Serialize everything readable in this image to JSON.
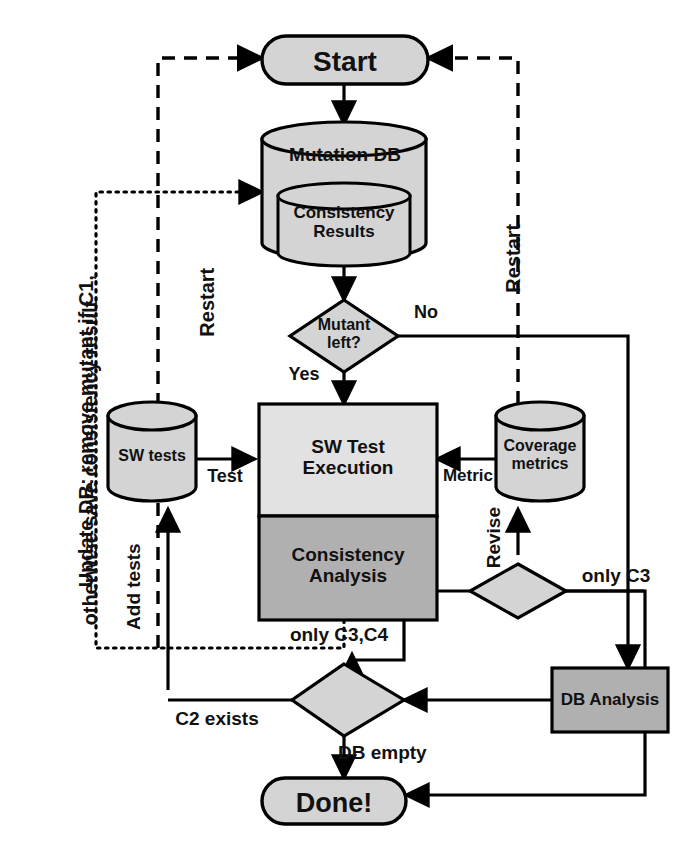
{
  "diagram": {
    "colors": {
      "light_fill": "#d4d4d4",
      "dark_fill": "#b0b0b0",
      "stroke": "#000000",
      "background": "#ffffff"
    },
    "nodes": [
      {
        "id": "start",
        "shape": "rounded-rect",
        "label": "Start",
        "fill": "light"
      },
      {
        "id": "mutation-db",
        "shape": "cylinder",
        "label": "Mutation DB",
        "fill": "light"
      },
      {
        "id": "consistency-results",
        "shape": "cylinder",
        "label": "Consistency\nResults",
        "fill": "light"
      },
      {
        "id": "mutant-left",
        "shape": "diamond",
        "label": "Mutant\nleft?",
        "fill": "light"
      },
      {
        "id": "sw-tests",
        "shape": "cylinder",
        "label": "SW tests",
        "fill": "light"
      },
      {
        "id": "sw-test-execution",
        "shape": "rect",
        "label": "SW Test\nExecution",
        "fill": "light"
      },
      {
        "id": "consistency-analysis",
        "shape": "rect",
        "label": "Consistency\nAnalysis",
        "fill": "dark"
      },
      {
        "id": "coverage-metrics",
        "shape": "cylinder",
        "label": "Coverage\nmetrics",
        "fill": "light"
      },
      {
        "id": "revise-decision",
        "shape": "diamond",
        "label": "",
        "fill": "light"
      },
      {
        "id": "db-decision",
        "shape": "diamond",
        "label": "",
        "fill": "light"
      },
      {
        "id": "db-analysis",
        "shape": "rect",
        "label": "DB Analysis",
        "fill": "dark"
      },
      {
        "id": "done",
        "shape": "rounded-rect",
        "label": "Done!",
        "fill": "light"
      }
    ],
    "edge_labels": [
      {
        "id": "no",
        "text": "No",
        "orientation": "horizontal"
      },
      {
        "id": "yes",
        "text": "Yes",
        "orientation": "horizontal"
      },
      {
        "id": "test",
        "text": "Test",
        "orientation": "horizontal"
      },
      {
        "id": "metric",
        "text": "Metric",
        "orientation": "horizontal"
      },
      {
        "id": "add-tests",
        "text": "Add tests",
        "orientation": "vertical"
      },
      {
        "id": "revise",
        "text": "Revise",
        "orientation": "vertical"
      },
      {
        "id": "restart-left",
        "text": "Restart",
        "orientation": "vertical"
      },
      {
        "id": "restart-right",
        "text": "Restart",
        "orientation": "vertical"
      },
      {
        "id": "only-c3",
        "text": "only C3",
        "orientation": "horizontal"
      },
      {
        "id": "only-c3-c4",
        "text": "only C3,C4",
        "orientation": "horizontal"
      },
      {
        "id": "c2-exists",
        "text": "C2 exists",
        "orientation": "horizontal"
      },
      {
        "id": "db-empty",
        "text": "DB empty",
        "orientation": "horizontal"
      }
    ],
    "annotations": [
      {
        "id": "update-db-note",
        "line1": "Update DB: remove mutant if C1,",
        "line2": "otherwise save consistency result",
        "orientation": "vertical"
      }
    ]
  }
}
